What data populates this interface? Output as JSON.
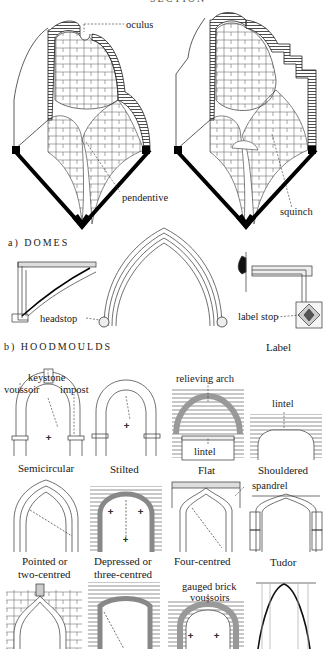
{
  "page": {
    "partial_header": "SECTION"
  },
  "domes": {
    "section_label": "a) DOMES",
    "labels": {
      "oculus": "oculus",
      "pendentive": "pendentive",
      "squinch": "squinch"
    }
  },
  "hoodmoulds": {
    "section_label": "b) HOODMOULDS",
    "labels": {
      "headstop": "headstop",
      "label_stop": "label stop",
      "label_caption": "Label"
    }
  },
  "arches": {
    "row1": [
      {
        "caption": "Semicircular",
        "annotations": [
          "keystone",
          "voussoir",
          "impost"
        ]
      },
      {
        "caption": "Stilted",
        "annotations": []
      },
      {
        "caption": "Flat",
        "annotations": [
          "relieving arch",
          "lintel"
        ]
      },
      {
        "caption": "Shouldered",
        "annotations": [
          "lintel"
        ]
      }
    ],
    "row2": [
      {
        "caption_line1": "Pointed or",
        "caption_line2": "two-centred"
      },
      {
        "caption_line1": "Depressed or",
        "caption_line2": "three-centred"
      },
      {
        "caption_line1": "Four-centred",
        "annotation": "spandrel"
      },
      {
        "caption_line1": "Tudor"
      }
    ],
    "row3": [
      {
        "caption": ""
      },
      {
        "caption": ""
      },
      {
        "annotation_line1": "gauged brick",
        "annotation_line2": "voussoirs"
      },
      {
        "caption": ""
      }
    ]
  },
  "colors": {
    "ink": "#1a1a1a",
    "paper": "#ffffff"
  }
}
